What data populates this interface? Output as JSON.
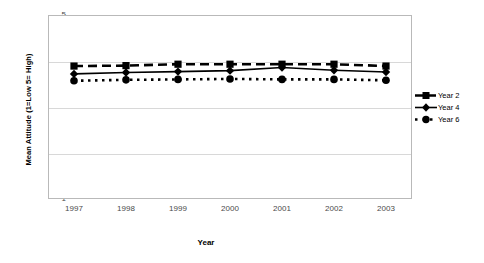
{
  "chart_data": {
    "type": "line",
    "title": "",
    "xlabel": "Year",
    "ylabel": "Mean Attitude (1=Low 5= High)",
    "categories": [
      "1997",
      "1998",
      "1999",
      "2000",
      "2001",
      "2002",
      "2003"
    ],
    "ylim": [
      1,
      5
    ],
    "yticks": [
      "1",
      "2",
      "3",
      "4",
      "5"
    ],
    "grid": true,
    "legend_position": "right",
    "series": [
      {
        "name": "Year 2",
        "marker": "square",
        "line_style": "dashed",
        "color": "#000000",
        "values": [
          3.89,
          3.9,
          3.93,
          3.93,
          3.93,
          3.93,
          3.89
        ]
      },
      {
        "name": "Year 4",
        "marker": "diamond",
        "line_style": "solid",
        "color": "#000000",
        "values": [
          3.72,
          3.75,
          3.77,
          3.79,
          3.86,
          3.8,
          3.76
        ]
      },
      {
        "name": "Year 6",
        "marker": "circle",
        "line_style": "dotted",
        "color": "#000000",
        "values": [
          3.57,
          3.59,
          3.6,
          3.61,
          3.6,
          3.6,
          3.58
        ]
      }
    ]
  },
  "axes": {
    "y_title": "Mean Attitude (1=Low 5= High)",
    "x_title": "Year"
  },
  "legend": {
    "items": [
      {
        "label": "Year 2"
      },
      {
        "label": "Year 4"
      },
      {
        "label": "Year 6"
      }
    ]
  }
}
